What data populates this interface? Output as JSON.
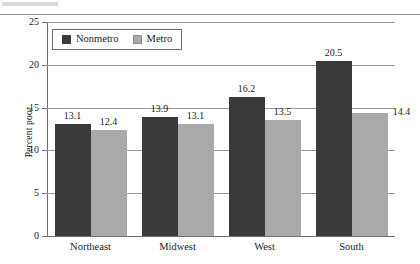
{
  "chart_data": {
    "type": "bar",
    "title": "",
    "xlabel": "",
    "ylabel": "Percent poor",
    "ylim": [
      0,
      25
    ],
    "yticks": [
      0,
      5,
      10,
      15,
      20,
      25
    ],
    "grid": true,
    "legend_position": "top-left",
    "categories": [
      "Northeast",
      "Midwest",
      "West",
      "South"
    ],
    "series": [
      {
        "name": "Nonmetro",
        "color": "#3a3a3a",
        "values": [
          13.1,
          13.9,
          16.2,
          20.5
        ],
        "labels": [
          "13.1",
          "13.9",
          "16.2",
          "20.5"
        ]
      },
      {
        "name": "Metro",
        "color": "#a9a9a9",
        "values": [
          12.4,
          13.1,
          13.5,
          14.4
        ],
        "labels": [
          "12.4",
          "13.1",
          "13.5",
          "14.4"
        ]
      }
    ],
    "ytick_labels": [
      "0",
      "5",
      "10",
      "15",
      "20",
      "25"
    ]
  },
  "legend": {
    "items": [
      {
        "label": "Nonmetro",
        "swatch": "nonmetro-swatch"
      },
      {
        "label": "Metro",
        "swatch": "metro-swatch"
      }
    ]
  }
}
